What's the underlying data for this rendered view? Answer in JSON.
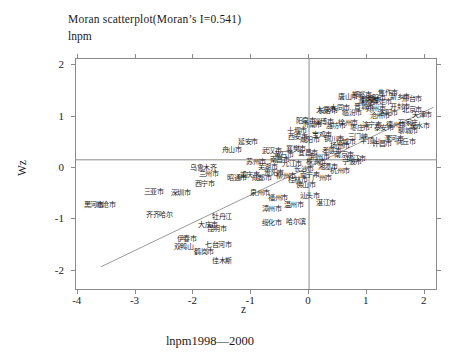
{
  "header": {
    "title": "Moran scatterplot(Moran’s I=0.541)",
    "subtitle": "lnpm"
  },
  "footer": {
    "caption": "lnpm1998—2000"
  },
  "axes": {
    "x_label": "z",
    "y_label": "Wz",
    "x_ticks": [
      -4,
      -3,
      -2,
      -1,
      0,
      1,
      2
    ],
    "y_ticks": [
      2,
      1,
      0,
      -1,
      -2
    ],
    "x_range": [
      -4.03,
      2.23
    ],
    "y_range": [
      -2.39,
      2.12
    ]
  },
  "chart_data": {
    "type": "scatter",
    "title": "Moran scatterplot(Moran’s I=0.541)",
    "moran_i": 0.541,
    "xlabel": "z",
    "ylabel": "Wz",
    "xlim": [
      -4.03,
      2.23
    ],
    "ylim": [
      -2.39,
      2.12
    ],
    "grid": false,
    "marker_style": "city-name-text-labels",
    "lines": {
      "vertical_at_z": 0,
      "horizontal_at_wz": 0.16,
      "regression": {
        "slope": 0.541,
        "x1": -3.6,
        "y1": -1.92,
        "x2": 2.15,
        "y2": 1.18
      }
    },
    "labeled_points": [
      {
        "t": "舟山市",
        "z": -1.49,
        "w": 0.35
      },
      {
        "t": "延安市",
        "z": -1.21,
        "w": 0.5
      },
      {
        "t": "十堰市",
        "z": -0.36,
        "w": 0.72
      },
      {
        "t": "阳泉市",
        "z": -0.21,
        "w": 0.91
      },
      {
        "t": "长治市",
        "z": 0.17,
        "w": 1.09
      },
      {
        "t": "鹤壁市",
        "z": 0.92,
        "w": 1.32
      },
      {
        "t": "石家庄",
        "z": 1.56,
        "w": 0.87
      },
      {
        "t": "乌鲁木齐",
        "z": -2.04,
        "w": 0.0
      },
      {
        "t": "兰州市",
        "z": -1.89,
        "w": -0.12
      },
      {
        "t": "西宁市",
        "z": -1.96,
        "w": -0.31
      },
      {
        "t": "昭通市",
        "z": -1.4,
        "w": -0.21
      },
      {
        "t": "三亚市",
        "z": -2.84,
        "w": -0.47
      },
      {
        "t": "深圳市",
        "z": -2.37,
        "w": -0.49
      },
      {
        "t": "黑河市",
        "z": -3.88,
        "w": -0.72
      },
      {
        "t": "临沧市",
        "z": -3.67,
        "w": -0.72
      },
      {
        "t": "齐齐哈尔",
        "z": -2.8,
        "w": -0.93
      },
      {
        "t": "牡丹江",
        "z": -1.66,
        "w": -0.97
      },
      {
        "t": "漳州市",
        "z": -0.8,
        "w": -0.8
      },
      {
        "t": "绥化市",
        "z": -0.8,
        "w": -1.07
      },
      {
        "t": "哈尔滨",
        "z": -0.38,
        "w": -1.05
      },
      {
        "t": "大庆市",
        "z": -1.9,
        "w": -1.11
      },
      {
        "t": "昆明市",
        "z": -1.75,
        "w": -1.2
      },
      {
        "t": "伊春市",
        "z": -2.27,
        "w": -1.38
      },
      {
        "t": "双鸭山",
        "z": -2.32,
        "w": -1.55
      },
      {
        "t": "七台河市",
        "z": -1.78,
        "w": -1.5
      },
      {
        "t": "鹤岗市",
        "z": -1.97,
        "w": -1.65
      },
      {
        "t": "佳木斯",
        "z": -1.66,
        "w": -1.81
      }
    ],
    "cluster_points": [
      {
        "t": "唐山市",
        "z": 0.52,
        "w": 1.38
      },
      {
        "t": "邯郸市",
        "z": 0.76,
        "w": 1.42
      },
      {
        "t": "安阳市",
        "z": 1.0,
        "w": 1.36
      },
      {
        "t": "焦作市",
        "z": 1.21,
        "w": 1.44
      },
      {
        "t": "新乡市",
        "z": 1.42,
        "w": 1.38
      },
      {
        "t": "邢台市",
        "z": 1.63,
        "w": 1.34
      },
      {
        "t": "保定市",
        "z": 1.11,
        "w": 1.28
      },
      {
        "t": "濮阳市",
        "z": 0.87,
        "w": 1.3
      },
      {
        "t": "太原市",
        "z": 0.14,
        "w": 1.11
      },
      {
        "t": "大同市",
        "z": 0.38,
        "w": 1.15
      },
      {
        "t": "临汾市",
        "z": 0.59,
        "w": 1.07
      },
      {
        "t": "晋城市",
        "z": 0.8,
        "w": 1.18
      },
      {
        "t": "郑州市",
        "z": 1.0,
        "w": 1.13
      },
      {
        "t": "洛阳市",
        "z": 1.21,
        "w": 1.07
      },
      {
        "t": "开封市",
        "z": 1.42,
        "w": 1.17
      },
      {
        "t": "北京市",
        "z": 1.63,
        "w": 1.11
      },
      {
        "t": "天津市",
        "z": 1.8,
        "w": 1.03
      },
      {
        "t": "沧州市",
        "z": 1.07,
        "w": 1.01
      },
      {
        "t": "济南市",
        "z": -0.1,
        "w": 0.83
      },
      {
        "t": "淄博市",
        "z": 0.1,
        "w": 0.89
      },
      {
        "t": "潍坊市",
        "z": 0.31,
        "w": 0.8
      },
      {
        "t": "徐州市",
        "z": 0.52,
        "w": 0.87
      },
      {
        "t": "枣庄市",
        "z": 0.73,
        "w": 0.76
      },
      {
        "t": "济宁市",
        "z": 0.93,
        "w": 0.83
      },
      {
        "t": "泰安市",
        "z": 1.14,
        "w": 0.76
      },
      {
        "t": "德州市",
        "z": 1.35,
        "w": 0.82
      },
      {
        "t": "聊城市",
        "z": 1.56,
        "w": 0.72
      },
      {
        "t": "衡水市",
        "z": 1.76,
        "w": 0.8
      },
      {
        "t": "西安市",
        "z": -0.35,
        "w": 0.6
      },
      {
        "t": "咸阳市",
        "z": -0.14,
        "w": 0.54
      },
      {
        "t": "宝鸡市",
        "z": 0.07,
        "w": 0.64
      },
      {
        "t": "铜川市",
        "z": 0.28,
        "w": 0.56
      },
      {
        "t": "运城市",
        "z": 0.48,
        "w": 0.49
      },
      {
        "t": "三门峡",
        "z": 0.69,
        "w": 0.6
      },
      {
        "t": "平顶山",
        "z": 0.9,
        "w": 0.52
      },
      {
        "t": "许昌市",
        "z": 1.11,
        "w": 0.45
      },
      {
        "t": "漯河市",
        "z": 1.31,
        "w": 0.56
      },
      {
        "t": "商丘市",
        "z": 1.52,
        "w": 0.49
      },
      {
        "t": "武汉市",
        "z": -0.8,
        "w": 0.33
      },
      {
        "t": "黄石市",
        "z": -0.59,
        "w": 0.25
      },
      {
        "t": "襄樊市",
        "z": -0.38,
        "w": 0.37
      },
      {
        "t": "宜昌市",
        "z": -0.17,
        "w": 0.29
      },
      {
        "t": "荆州市",
        "z": 0.03,
        "w": 0.21
      },
      {
        "t": "孝感市",
        "z": 0.24,
        "w": 0.33
      },
      {
        "t": "南京市",
        "z": 0.45,
        "w": 0.25
      },
      {
        "t": "镇江市",
        "z": 0.66,
        "w": 0.17
      },
      {
        "t": "扬州市",
        "z": 0.38,
        "w": 0.41
      },
      {
        "t": "苏州市",
        "z": -1.07,
        "w": 0.1
      },
      {
        "t": "芜湖市",
        "z": -0.87,
        "w": 0.02
      },
      {
        "t": "南昌市",
        "z": -0.66,
        "w": 0.14
      },
      {
        "t": "九江市",
        "z": -0.45,
        "w": 0.06
      },
      {
        "t": "长沙市",
        "z": -0.24,
        "w": -0.02
      },
      {
        "t": "株洲市",
        "z": -0.03,
        "w": 0.1
      },
      {
        "t": "湘潭市",
        "z": 0.17,
        "w": 0.02
      },
      {
        "t": "杭州市",
        "z": 0.38,
        "w": -0.06
      },
      {
        "t": "宁波市",
        "z": 0.59,
        "w": 0.1
      },
      {
        "t": "重庆市",
        "z": -1.18,
        "w": -0.14
      },
      {
        "t": "成都市",
        "z": -0.97,
        "w": -0.21
      },
      {
        "t": "贵阳市",
        "z": -0.76,
        "w": -0.1
      },
      {
        "t": "柳州市",
        "z": -0.55,
        "w": -0.17
      },
      {
        "t": "桂林市",
        "z": -0.35,
        "w": -0.25
      },
      {
        "t": "南宁市",
        "z": -0.14,
        "w": -0.14
      },
      {
        "t": "广州市",
        "z": 0.07,
        "w": -0.21
      },
      {
        "t": "佛山市",
        "z": -0.21,
        "w": -0.33
      },
      {
        "t": "泉州市",
        "z": -1.0,
        "w": -0.49
      },
      {
        "t": "福州市",
        "z": -0.69,
        "w": -0.6
      },
      {
        "t": "温州市",
        "z": -0.42,
        "w": -0.72
      },
      {
        "t": "汕头市",
        "z": -0.14,
        "w": -0.56
      },
      {
        "t": "湛江市",
        "z": 0.14,
        "w": -0.68
      }
    ]
  },
  "colors": {
    "frame": "#8a8a8a",
    "lines": "#8a8a8a",
    "regression": "#9a9a9a",
    "text": "#1a1a1a",
    "points": "#222222"
  }
}
